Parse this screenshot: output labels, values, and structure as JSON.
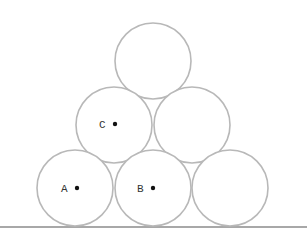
{
  "diagram": {
    "stroke_color": "#b8b8b8",
    "ground_color": "#a8a8a8",
    "dot_color": "#111111",
    "labels": {
      "A": "A",
      "B": "B",
      "C": "C"
    },
    "circles": [
      {
        "id": "top",
        "cx": 153,
        "cy": 61,
        "r": 38
      },
      {
        "id": "mid-left-C",
        "cx": 114,
        "cy": 125,
        "r": 38
      },
      {
        "id": "mid-right",
        "cx": 192,
        "cy": 125,
        "r": 38
      },
      {
        "id": "bottom-left-A",
        "cx": 75,
        "cy": 188,
        "r": 38
      },
      {
        "id": "bottom-mid-B",
        "cx": 153,
        "cy": 188,
        "r": 38
      },
      {
        "id": "bottom-right",
        "cx": 230,
        "cy": 188,
        "r": 38
      }
    ],
    "points": [
      {
        "label": "A",
        "x": 77,
        "y": 188
      },
      {
        "label": "B",
        "x": 153,
        "y": 188
      },
      {
        "label": "C",
        "x": 115,
        "y": 124
      }
    ]
  }
}
